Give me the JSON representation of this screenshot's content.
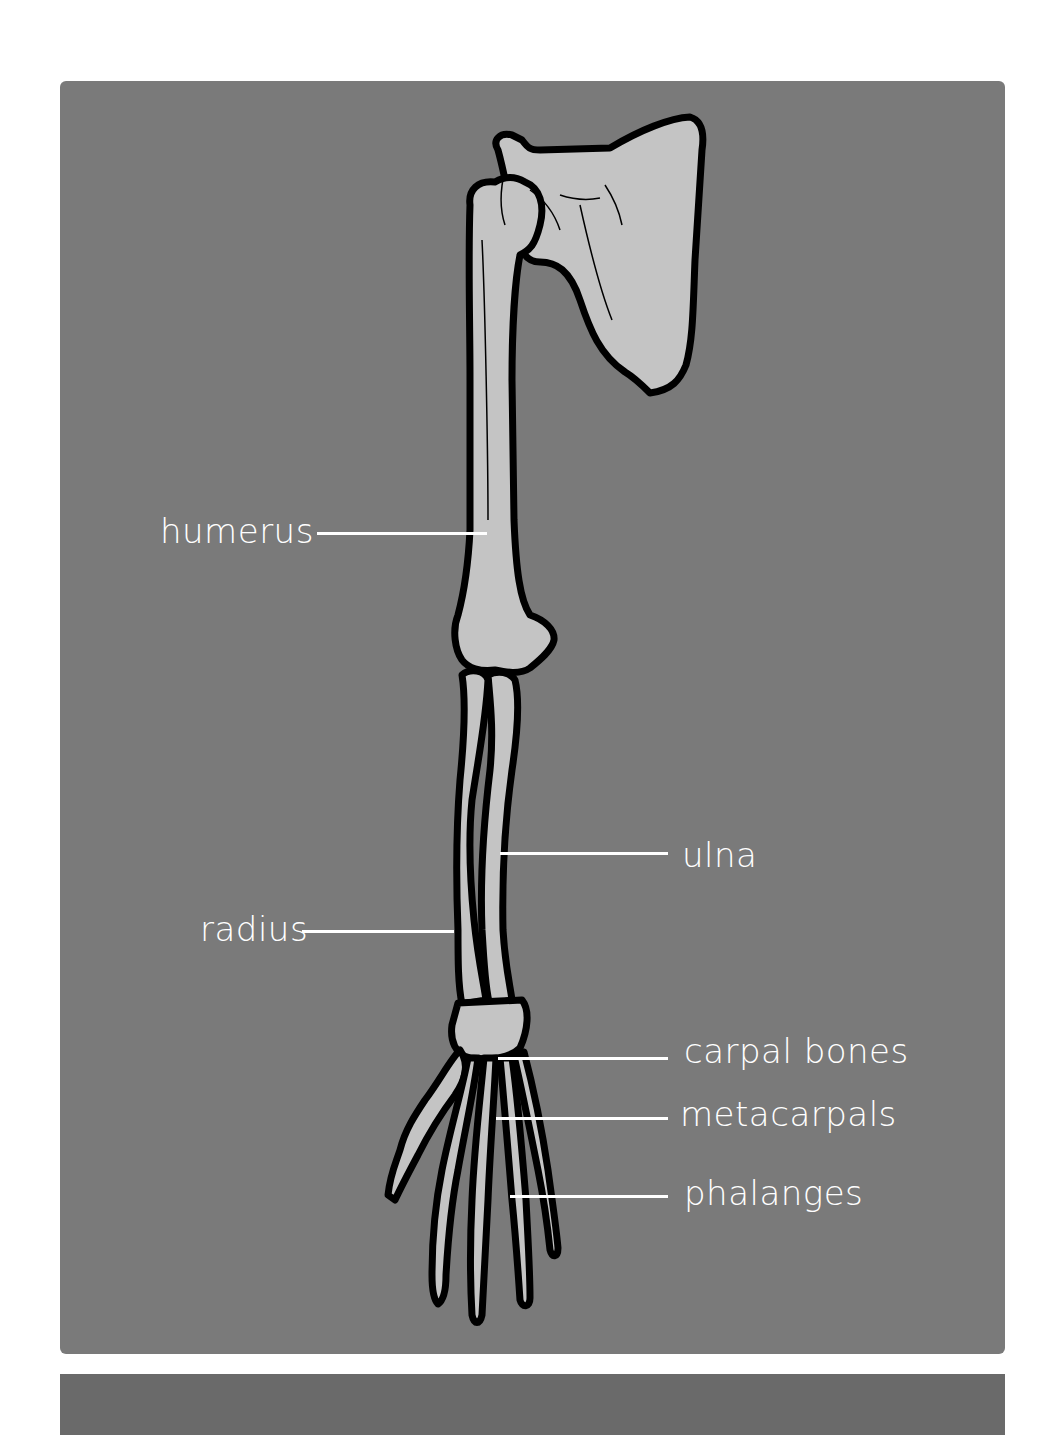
{
  "diagram": {
    "colors": {
      "background_panel": "#7a7a7a",
      "bottom_panel": "#6a6a6a",
      "bone_fill": "#c4c4c4",
      "bone_outline": "#000000",
      "label_text": "#ffffff"
    },
    "labels": [
      {
        "id": "humerus",
        "text": "humerus"
      },
      {
        "id": "ulna",
        "text": "ulna"
      },
      {
        "id": "radius",
        "text": "radius"
      },
      {
        "id": "carpal_bones",
        "text": "carpal bones"
      },
      {
        "id": "metacarpals",
        "text": "metacarpals"
      },
      {
        "id": "phalanges",
        "text": "phalanges"
      }
    ]
  }
}
